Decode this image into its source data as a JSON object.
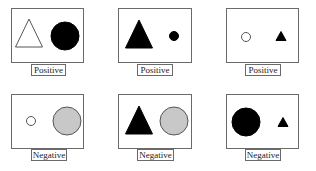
{
  "figure": {
    "panels": [
      {
        "row": 0,
        "col": 0,
        "label": "Positive",
        "frame": {
          "x": 11,
          "y": 8,
          "w": 73,
          "h": 55
        },
        "labelBox": {
          "x": 31,
          "y": 64,
          "w": 35,
          "h": 12
        },
        "shapes": [
          {
            "type": "triangle",
            "fill": "#ffffff",
            "stroke": "#555555",
            "size": "large",
            "cx": 17,
            "cy": 24,
            "w": 27,
            "h": 28
          },
          {
            "type": "circle",
            "fill": "#000000",
            "stroke": "#000000",
            "size": "large",
            "cx": 53,
            "cy": 27,
            "r": 14
          }
        ]
      },
      {
        "row": 0,
        "col": 1,
        "label": "Positive",
        "frame": {
          "x": 118,
          "y": 8,
          "w": 74,
          "h": 55
        },
        "labelBox": {
          "x": 137,
          "y": 64,
          "w": 36,
          "h": 12
        },
        "shapes": [
          {
            "type": "triangle",
            "fill": "#000000",
            "stroke": "#000000",
            "size": "large",
            "cx": 20,
            "cy": 25,
            "w": 27,
            "h": 28
          },
          {
            "type": "circle",
            "fill": "#000000",
            "stroke": "#000000",
            "size": "small",
            "cx": 55,
            "cy": 27,
            "r": 4.5
          }
        ]
      },
      {
        "row": 0,
        "col": 2,
        "label": "Positive",
        "frame": {
          "x": 226,
          "y": 8,
          "w": 73,
          "h": 55
        },
        "labelBox": {
          "x": 245,
          "y": 64,
          "w": 36,
          "h": 12
        },
        "shapes": [
          {
            "type": "circle",
            "fill": "#ffffff",
            "stroke": "#555555",
            "size": "small",
            "cx": 19,
            "cy": 28,
            "r": 4.5
          },
          {
            "type": "triangle",
            "fill": "#000000",
            "stroke": "#000000",
            "size": "small",
            "cx": 54,
            "cy": 27,
            "w": 10,
            "h": 9
          }
        ]
      },
      {
        "row": 1,
        "col": 0,
        "label": "Negative",
        "frame": {
          "x": 11,
          "y": 94,
          "w": 73,
          "h": 55
        },
        "labelBox": {
          "x": 31,
          "y": 149,
          "w": 36,
          "h": 12
        },
        "shapes": [
          {
            "type": "circle",
            "fill": "#ffffff",
            "stroke": "#555555",
            "size": "small",
            "cx": 19,
            "cy": 26,
            "r": 4.5
          },
          {
            "type": "circle",
            "fill": "#c8c8c8",
            "stroke": "#555555",
            "size": "large",
            "cx": 55,
            "cy": 26,
            "r": 14
          }
        ]
      },
      {
        "row": 1,
        "col": 1,
        "label": "Negative",
        "frame": {
          "x": 118,
          "y": 94,
          "w": 74,
          "h": 55
        },
        "labelBox": {
          "x": 137,
          "y": 149,
          "w": 37,
          "h": 12
        },
        "shapes": [
          {
            "type": "triangle",
            "fill": "#000000",
            "stroke": "#000000",
            "size": "large",
            "cx": 20,
            "cy": 25,
            "w": 27,
            "h": 28
          },
          {
            "type": "circle",
            "fill": "#c8c8c8",
            "stroke": "#555555",
            "size": "large",
            "cx": 55,
            "cy": 26,
            "r": 14
          }
        ]
      },
      {
        "row": 1,
        "col": 2,
        "label": "Negative",
        "frame": {
          "x": 226,
          "y": 94,
          "w": 73,
          "h": 55
        },
        "labelBox": {
          "x": 245,
          "y": 149,
          "w": 36,
          "h": 12
        },
        "shapes": [
          {
            "type": "circle",
            "fill": "#000000",
            "stroke": "#000000",
            "size": "large",
            "cx": 19,
            "cy": 27,
            "r": 14
          },
          {
            "type": "triangle",
            "fill": "#000000",
            "stroke": "#000000",
            "size": "small",
            "cx": 56,
            "cy": 27,
            "w": 10,
            "h": 9
          }
        ]
      }
    ]
  }
}
